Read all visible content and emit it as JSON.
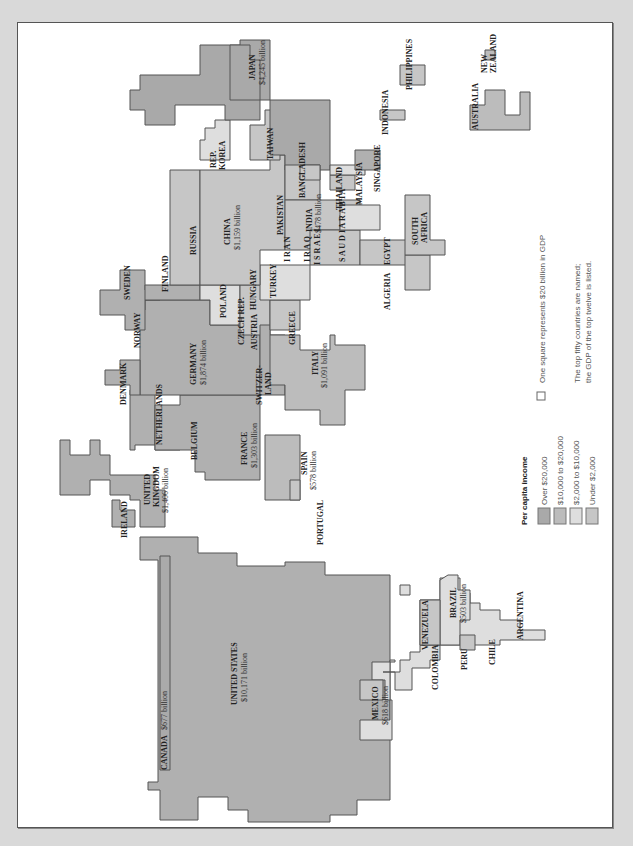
{
  "colors": {
    "over_20000": "#a9a9a9",
    "c10000_20000": "#bcbcbc",
    "c2000_10000": "#dedede",
    "under_2000": "#c6c6c6",
    "outline": "#555555",
    "frame_bg": "#d9d9d9"
  },
  "legend": {
    "title": "Per capita income",
    "items": [
      {
        "label": "Over $20,000",
        "color": "#a9a9a9"
      },
      {
        "label": "$10,000 to $20,000",
        "color": "#bcbcbc"
      },
      {
        "label": "$2,000 to $10,000",
        "color": "#dedede"
      },
      {
        "label": "Under $2,000",
        "color": "#c6c6c6"
      }
    ],
    "square_note": "One square represents $20 billion in GDP",
    "note_line1": "The top fifty countries are named;",
    "note_line2": "the GDP of the top twelve is listed."
  },
  "countries": {
    "usa": {
      "name": "UNITED STATES",
      "gdp": "$10,171 billion"
    },
    "canada": {
      "name": "CANADA",
      "gdp": "$677 billion"
    },
    "mexico": {
      "name": "MEXICO",
      "gdp": "$618 billion"
    },
    "brazil": {
      "name": "BRAZIL",
      "gdp": "$503 billion"
    },
    "venezuela": {
      "name": "VENEZUELA"
    },
    "colombia": {
      "name": "COLOMBIA"
    },
    "peru": {
      "name": "PERU"
    },
    "chile": {
      "name": "CHILE"
    },
    "argentina": {
      "name": "ARGENTINA"
    },
    "ireland": {
      "name": "IRELAND"
    },
    "uk": {
      "name1": "UNITED",
      "name2": "KINGDOM",
      "gdp": "$1,406 billion"
    },
    "france": {
      "name": "FRANCE",
      "gdp": "$1,303 billion"
    },
    "spain": {
      "name": "SPAIN",
      "gdp": "$578 billion"
    },
    "portugal": {
      "name": "PORTUGAL"
    },
    "belgium": {
      "name": "BELGIUM"
    },
    "netherlands": {
      "name": "NETHERLANDS"
    },
    "denmark": {
      "name": "DENMARK"
    },
    "germany": {
      "name": "GERMANY",
      "gdp": "$1,874 billion"
    },
    "switzerland": {
      "name1": "SWITZER-",
      "name2": "LAND"
    },
    "italy": {
      "name": "ITALY",
      "gdp": "$1,091 billion"
    },
    "norway": {
      "name": "NORWAY"
    },
    "sweden": {
      "name": "SWEDEN"
    },
    "finland": {
      "name": "FINLAND"
    },
    "poland": {
      "name": "POLAND"
    },
    "czech": {
      "name": "CZECH REP."
    },
    "austria": {
      "name": "AUSTRIA"
    },
    "hungary": {
      "name": "HUNGARY"
    },
    "greece": {
      "name": "GREECE"
    },
    "turkey": {
      "name": "TURKEY"
    },
    "russia": {
      "name": "RUSSIA"
    },
    "china": {
      "name": "CHINA",
      "gdp": "$1,159 billion"
    },
    "korea": {
      "name1": "REP.",
      "name2": "KOREA"
    },
    "taiwan": {
      "name": "TAIWAN"
    },
    "japan": {
      "name": "JAPAN",
      "gdp": "$4,245 billion"
    },
    "pakistan": {
      "name": "PAKISTAN"
    },
    "bangladesh": {
      "name": "BANGLADESH"
    },
    "india": {
      "name": "INDIA",
      "gdp": "$478 billion"
    },
    "iran": {
      "name": "I R A N"
    },
    "iraq": {
      "name": "I R A Q"
    },
    "israel": {
      "name": "I S R A E L"
    },
    "saudi": {
      "name": "S A U D I  A R A B I A"
    },
    "egypt": {
      "name": "EGYPT"
    },
    "algeria": {
      "name": "ALGERIA"
    },
    "south_africa": {
      "name1": "SOUTH",
      "name2": "AFRICA"
    },
    "thailand": {
      "name": "THAILAND"
    },
    "malaysia": {
      "name": "MALAYSIA"
    },
    "singapore": {
      "name": "SINGAPORE"
    },
    "indonesia": {
      "name": "INDONESIA"
    },
    "philippines": {
      "name": "PHILIPPINES"
    },
    "australia": {
      "name": "AUSTRALIA"
    },
    "new_zealand": {
      "name1": "NEW",
      "name2": "ZEALAND"
    }
  }
}
